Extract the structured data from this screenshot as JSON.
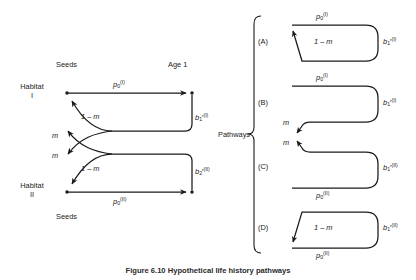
{
  "figure": {
    "caption": "Figure 6.10   Hypothetical life history pathways",
    "left_diagram": {
      "name": "two-habitat life cycle graph",
      "column_headers": {
        "left": "Seeds",
        "right": "Age 1"
      },
      "row_labels": {
        "top": "Habitat I",
        "top_line1": "Habitat",
        "top_line2": "I",
        "bottom_line1": "Habitat",
        "bottom_line2": "II"
      },
      "bottom_left_label": "Seeds",
      "edge_labels": {
        "top_survival": "p0(I)",
        "top_survival_base": "p",
        "top_survival_sub": "0",
        "top_survival_sup": "(I)",
        "bottom_survival_base": "p",
        "bottom_survival_sub": "0",
        "bottom_survival_sup": "(II)",
        "fecundity_top_base": "b",
        "fecundity_top_sub": "1",
        "fecundity_top_prime": "′",
        "fecundity_top_sup": "(I)",
        "fecundity_bottom_base": "b",
        "fecundity_bottom_sub": "2",
        "fecundity_bottom_prime": "′",
        "fecundity_bottom_sup": "(II)",
        "stay_top": "1 – m",
        "stay_bottom": "1 – m",
        "migrate_upper": "m",
        "migrate_lower": "m"
      }
    },
    "right_panel": {
      "bracket_label": "Pathways",
      "panels": [
        {
          "id": "(A)",
          "top_label_base": "p",
          "top_label_sub": "0",
          "top_label_sup": "(I)",
          "right_label_base": "b",
          "right_label_sub": "1",
          "right_label_prime": "′",
          "right_label_sup": "(I)",
          "inner_label": "1 – m",
          "bottom_label_base": "",
          "bottom_label_sub": "",
          "bottom_label_sup": ""
        },
        {
          "id": "(B)",
          "top_label_base": "p",
          "top_label_sub": "0",
          "top_label_sup": "(I)",
          "right_label_base": "b",
          "right_label_sub": "1",
          "right_label_prime": "′",
          "right_label_sup": "(I)",
          "inner_label": "m",
          "bottom_label_base": "",
          "bottom_label_sub": "",
          "bottom_label_sup": ""
        },
        {
          "id": "(C)",
          "top_label_base": "",
          "top_label_sub": "",
          "top_label_sup": "",
          "right_label_base": "b",
          "right_label_sub": "1",
          "right_label_prime": "′",
          "right_label_sup": "(II)",
          "inner_label": "m",
          "bottom_label_base": "p",
          "bottom_label_sub": "0",
          "bottom_label_sup": "(II)"
        },
        {
          "id": "(D)",
          "top_label_base": "",
          "top_label_sub": "",
          "top_label_sup": "",
          "right_label_base": "b",
          "right_label_sub": "1",
          "right_label_prime": "′",
          "right_label_sup": "(II)",
          "inner_label": "1 – m",
          "bottom_label_base": "p",
          "bottom_label_sub": "0",
          "bottom_label_sup": "(II)"
        }
      ]
    },
    "colors": {
      "ink": "#1a1a1a",
      "background": "#ffffff"
    }
  }
}
